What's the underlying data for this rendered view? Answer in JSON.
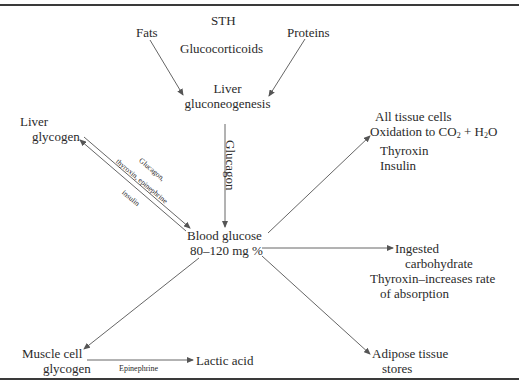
{
  "diagram": {
    "nodes": {
      "sth": "STH",
      "fats": "Fats",
      "glucocorticoids": "Glucocorticoids",
      "proteins": "Proteins",
      "liver_gluconeogenesis": [
        "Liver",
        "gluconeogenesis"
      ],
      "liver_glycogen": [
        "Liver",
        "glycogen"
      ],
      "blood_glucose": [
        "Blood glucose",
        "80–120 mg %"
      ],
      "all_tissue_cells": {
        "line1": "All tissue cells",
        "line2_prefix": "Oxidation to CO",
        "line2_sub1": "2",
        "line2_mid": " + H",
        "line2_sub2": "2",
        "line2_suffix": "O",
        "line3": "Thyroxin",
        "line4": "Insulin"
      },
      "ingested_carbohydrate": [
        "Ingested",
        "carbohydrate",
        "Thyroxin–increases rate",
        "of absorption"
      ],
      "muscle_cell_glycogen": [
        "Muscle cell",
        "glycogen"
      ],
      "lactic_acid": "Lactic acid",
      "adipose_tissue": [
        "Adipose tissue",
        "stores"
      ]
    },
    "edge_labels": {
      "glucagon_vertical": "Glucagon",
      "glycogenolysis_upper_1": "Glucagon,",
      "glycogenolysis_upper_2": "thyroxin, epinephrine",
      "glycogenesis_lower": "insulin",
      "epinephrine": "Epinephrine"
    },
    "edges": [
      {
        "from": "Fats",
        "to": "Liver gluconeogenesis"
      },
      {
        "from": "Proteins",
        "to": "Liver gluconeogenesis"
      },
      {
        "from": "Liver gluconeogenesis",
        "to": "Blood glucose",
        "label": "Glucagon"
      },
      {
        "from": "Liver glycogen",
        "to": "Blood glucose",
        "label": "Glucagon, thyroxin, epinephrine"
      },
      {
        "from": "Blood glucose",
        "to": "Liver glycogen",
        "label": "insulin"
      },
      {
        "from": "Blood glucose",
        "to": "All tissue cells"
      },
      {
        "from": "Blood glucose",
        "to": "Ingested carbohydrate"
      },
      {
        "from": "Blood glucose",
        "to": "Muscle cell glycogen"
      },
      {
        "from": "Blood glucose",
        "to": "Adipose tissue stores"
      },
      {
        "from": "Muscle cell glycogen",
        "to": "Lactic acid",
        "label": "Epinephrine"
      }
    ],
    "colors": {
      "ink": "#2a2a2a",
      "rule": "#3a3a3a",
      "arrow": "#555555"
    }
  }
}
